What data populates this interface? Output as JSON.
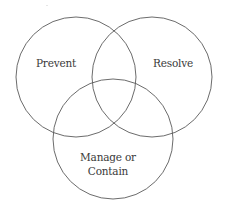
{
  "diagram": {
    "type": "venn",
    "stroke_color": "#5a5a5a",
    "text_color": "#3a3a3a",
    "background": "#ffffff",
    "sets": [
      {
        "id": "prevent",
        "label": "Prevent",
        "circle": {
          "cx": 76,
          "cy": 77,
          "r": 60
        },
        "label_pos": {
          "x": 56,
          "y": 63
        }
      },
      {
        "id": "resolve",
        "label": "Resolve",
        "circle": {
          "cx": 152,
          "cy": 77,
          "r": 60
        },
        "label_pos": {
          "x": 173,
          "y": 63
        }
      },
      {
        "id": "manage",
        "label_lines": [
          "Manage or",
          "Contain"
        ],
        "circle": {
          "cx": 113,
          "cy": 139,
          "r": 60
        },
        "label_pos": {
          "x": 108,
          "y": 164
        }
      }
    ]
  }
}
